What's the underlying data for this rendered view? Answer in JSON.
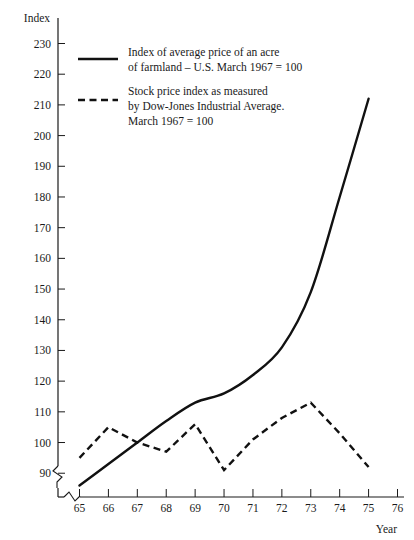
{
  "chart_data": {
    "type": "line",
    "title": "",
    "xlabel": "Year",
    "ylabel": "Index",
    "xlim": [
      64.5,
      76
    ],
    "ylim": [
      85,
      234
    ],
    "grid": false,
    "legend_position": "upper-left-inside",
    "x_tick_labels": [
      "65",
      "66",
      "67",
      "68",
      "69",
      "70",
      "71",
      "72",
      "73",
      "74",
      "75",
      "76"
    ],
    "x_ticks": [
      65,
      66,
      67,
      68,
      69,
      70,
      71,
      72,
      73,
      74,
      75,
      76
    ],
    "y_tick_labels": [
      "90",
      "100",
      "110",
      "120",
      "130",
      "140",
      "150",
      "160",
      "170",
      "180",
      "190",
      "200",
      "210",
      "220",
      "230"
    ],
    "y_ticks": [
      90,
      100,
      110,
      120,
      130,
      140,
      150,
      160,
      170,
      180,
      190,
      200,
      210,
      220,
      230
    ],
    "axis_break_x": true,
    "axis_break_y": true,
    "x": [
      65,
      66,
      67,
      68,
      69,
      70,
      71,
      72,
      73,
      74,
      75
    ],
    "series": [
      {
        "name": "farmland-index",
        "style": "solid",
        "legend_line1": "Index of average price of an acre",
        "legend_line2": "of farmland – U.S. March 1967 = 100",
        "values": [
          86,
          93,
          100,
          107,
          113,
          116,
          122,
          131,
          149,
          180,
          212
        ]
      },
      {
        "name": "stock-price-index",
        "style": "dashed",
        "legend_line1": "Stock price index as measured",
        "legend_line2": "by Dow-Jones Industrial Average.",
        "legend_line3": "March 1967 = 100",
        "values": [
          95,
          105,
          100,
          97,
          106,
          91,
          101,
          108,
          113,
          103,
          92
        ]
      }
    ]
  },
  "colors": {
    "ink": "#111111",
    "background": "#ffffff"
  }
}
